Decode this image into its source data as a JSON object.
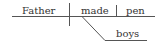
{
  "diagram": {
    "type": "sentence-diagram",
    "sentence": "Father made boys pen",
    "words": {
      "subject": "Father",
      "verb": "made",
      "object": "pen",
      "modifier": "boys"
    },
    "colors": {
      "line": "#555555",
      "text": "#333333",
      "background": "#ffffff"
    }
  }
}
